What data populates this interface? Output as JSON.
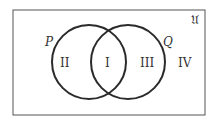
{
  "diagram": {
    "type": "venn",
    "universe_symbol": "𝔘",
    "sets": [
      {
        "name": "P",
        "label": "P"
      },
      {
        "name": "Q",
        "label": "Q"
      }
    ],
    "regions": [
      {
        "id": "I",
        "label": "I",
        "description": "P ∩ Q"
      },
      {
        "id": "II",
        "label": "II",
        "description": "P only"
      },
      {
        "id": "III",
        "label": "III",
        "description": "Q only"
      },
      {
        "id": "IV",
        "label": "IV",
        "description": "outside P and Q"
      }
    ],
    "colors": {
      "stroke": "#2b2b2b",
      "border": "#555555",
      "text": "#333333"
    }
  }
}
